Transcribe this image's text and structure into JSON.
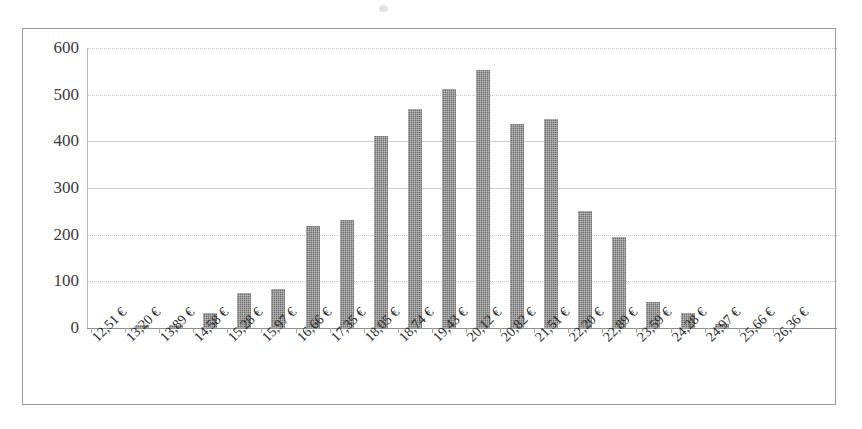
{
  "chart_data": {
    "type": "bar",
    "title": "",
    "subtitle": "",
    "xlabel": "",
    "ylabel": "",
    "ylim": [
      0,
      600
    ],
    "y_ticks": [
      0,
      100,
      200,
      300,
      400,
      500,
      600
    ],
    "grid": true,
    "legend": false,
    "legend_position": "none",
    "bar_color": "#6e6e6e",
    "categories": [
      "12,51 €",
      "13,20 €",
      "13,89 €",
      "14,58 €",
      "15,28 €",
      "15,97 €",
      "16,66 €",
      "17,35 €",
      "18,05 €",
      "18,74 €",
      "19,43 €",
      "20,12 €",
      "20,82 €",
      "21,51 €",
      "22,20 €",
      "22,89 €",
      "23,59 €",
      "24,28 €",
      "24,97 €",
      "25,66 €",
      "26,36 €"
    ],
    "values": [
      0,
      7,
      7,
      33,
      75,
      83,
      218,
      231,
      411,
      470,
      512,
      552,
      437,
      447,
      251,
      196,
      56,
      33,
      8,
      0,
      0
    ],
    "series": [
      {
        "name": "Frequency",
        "values": [
          0,
          7,
          7,
          33,
          75,
          83,
          218,
          231,
          411,
          470,
          512,
          552,
          437,
          447,
          251,
          196,
          56,
          33,
          8,
          0,
          0
        ]
      }
    ]
  },
  "axes": {
    "y_tick_labels": [
      "600",
      "500",
      "400",
      "300",
      "200",
      "100",
      "0"
    ]
  }
}
